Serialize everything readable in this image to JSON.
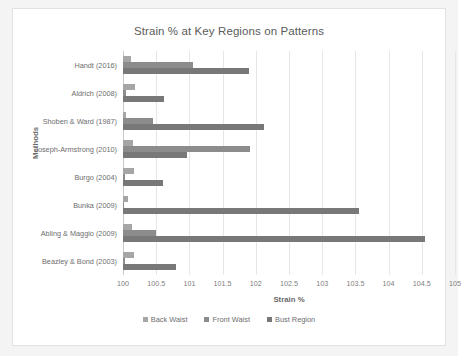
{
  "chart_data": {
    "type": "bar",
    "orientation": "horizontal",
    "title": "Strain % at Key Regions on Patterns",
    "xlabel": "Strain %",
    "ylabel": "Methods",
    "xlim": [
      100,
      105
    ],
    "grid": true,
    "legend_position": "bottom",
    "xticks": [
      "100",
      "100.5",
      "101",
      "101.5",
      "102",
      "102.5",
      "103",
      "103.5",
      "104",
      "104.5",
      "105"
    ],
    "xtick_values": [
      100,
      100.5,
      101,
      101.5,
      102,
      102.5,
      103,
      103.5,
      104,
      104.5,
      105
    ],
    "categories": [
      "Handt (2016)",
      "Aldrich (2008)",
      "Shoben & Ward (1987)",
      "Joseph-Armstrong (2010)",
      "Burgo (2004)",
      "Bunka (2009)",
      "Abling & Maggio (2009)",
      "Beazley & Bond (2003)"
    ],
    "series": [
      {
        "name": "Back Waist",
        "color": "#a6a6a6",
        "values": [
          100.12,
          100.18,
          100.05,
          100.15,
          100.17,
          100.07,
          100.14,
          100.16
        ]
      },
      {
        "name": "Front Waist",
        "color": "#8c8c8c",
        "values": [
          101.06,
          100.05,
          100.45,
          101.92,
          100.03,
          100.02,
          100.5,
          100.03
        ]
      },
      {
        "name": "Bust Region",
        "color": "#787878",
        "values": [
          101.9,
          100.62,
          102.12,
          100.96,
          100.6,
          103.55,
          104.55,
          100.8
        ]
      }
    ]
  }
}
